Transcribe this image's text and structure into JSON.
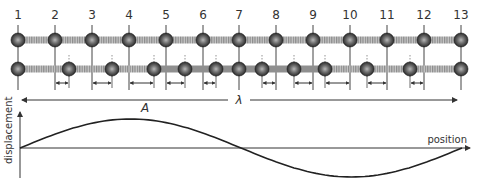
{
  "diagram": {
    "position_labels": [
      "1",
      "2",
      "3",
      "4",
      "5",
      "6",
      "7",
      "8",
      "9",
      "10",
      "11",
      "12",
      "13"
    ],
    "equilibrium_x": [
      18,
      55,
      92,
      129,
      166,
      203,
      239,
      276,
      313,
      350,
      387,
      424,
      461
    ],
    "displacements_px": [
      0,
      14,
      20,
      25,
      19,
      13,
      0,
      -14,
      -19,
      -25,
      -20,
      -14,
      0
    ],
    "amplitude_label": "A",
    "wavelength_label": "λ",
    "graph": {
      "ylabel": "displacement",
      "xlabel": "position",
      "curve": "one full sine cycle from position 1 to position 13"
    },
    "colors": {
      "ball_dark": "#2b2b2b",
      "ball_light": "#9a9a9a",
      "spring": "#9c9c9c",
      "line": "#333333"
    }
  }
}
